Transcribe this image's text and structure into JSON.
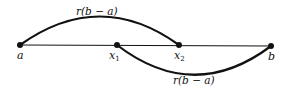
{
  "diagram": {
    "points": [
      {
        "id": "a",
        "label": "a",
        "x": 20,
        "y": 45
      },
      {
        "id": "x1",
        "label": "x",
        "sub": "1",
        "x": 117,
        "y": 45
      },
      {
        "id": "x2",
        "label": "x",
        "sub": "2",
        "x": 179,
        "y": 45
      },
      {
        "id": "b",
        "label": "b",
        "x": 271,
        "y": 46
      }
    ],
    "arcs": [
      {
        "from": "a",
        "to": "x2",
        "label": "r(b − a)",
        "side": "above"
      },
      {
        "from": "x1",
        "to": "b",
        "label": "r(b − a)",
        "side": "below"
      }
    ],
    "colors": {
      "stroke": "#111111",
      "background": "#ffffff"
    }
  }
}
